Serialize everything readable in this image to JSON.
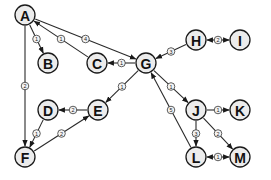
{
  "graph": {
    "type": "weighted-directed-graph",
    "nodes": [
      {
        "id": "A",
        "label": "A",
        "x": 25,
        "y": 15
      },
      {
        "id": "B",
        "label": "B",
        "x": 48,
        "y": 63
      },
      {
        "id": "C",
        "label": "C",
        "x": 97,
        "y": 63
      },
      {
        "id": "G",
        "label": "G",
        "x": 146,
        "y": 63
      },
      {
        "id": "H",
        "label": "H",
        "x": 196,
        "y": 40
      },
      {
        "id": "I",
        "label": "I",
        "x": 240,
        "y": 40
      },
      {
        "id": "D",
        "label": "D",
        "x": 48,
        "y": 110
      },
      {
        "id": "E",
        "label": "E",
        "x": 98,
        "y": 110
      },
      {
        "id": "F",
        "label": "F",
        "x": 25,
        "y": 157
      },
      {
        "id": "J",
        "label": "J",
        "x": 196,
        "y": 110
      },
      {
        "id": "K",
        "label": "K",
        "x": 240,
        "y": 110
      },
      {
        "id": "L",
        "label": "L",
        "x": 196,
        "y": 157
      },
      {
        "id": "M",
        "label": "M",
        "x": 240,
        "y": 157
      }
    ],
    "edges": [
      {
        "from": "A",
        "to": "B",
        "weight": "1",
        "direction": "forward"
      },
      {
        "from": "C",
        "to": "A",
        "weight": "1",
        "direction": "forward"
      },
      {
        "from": "A",
        "to": "G",
        "weight": "4",
        "direction": "forward"
      },
      {
        "from": "A",
        "to": "F",
        "weight": "2",
        "direction": "forward"
      },
      {
        "from": "G",
        "to": "C",
        "weight": "1",
        "direction": "forward"
      },
      {
        "from": "H",
        "to": "G",
        "weight": "3",
        "direction": "forward"
      },
      {
        "from": "H",
        "to": "I",
        "weight": "2",
        "direction": "both"
      },
      {
        "from": "G",
        "to": "E",
        "weight": "1",
        "direction": "forward"
      },
      {
        "from": "E",
        "to": "D",
        "weight": "2",
        "direction": "forward"
      },
      {
        "from": "D",
        "to": "F",
        "weight": "1",
        "direction": "forward"
      },
      {
        "from": "F",
        "to": "E",
        "weight": "2",
        "direction": "forward"
      },
      {
        "from": "G",
        "to": "J",
        "weight": "1",
        "direction": "forward"
      },
      {
        "from": "L",
        "to": "G",
        "weight": "5",
        "direction": "forward"
      },
      {
        "from": "J",
        "to": "K",
        "weight": "1",
        "direction": "forward"
      },
      {
        "from": "J",
        "to": "L",
        "weight": "3",
        "direction": "forward"
      },
      {
        "from": "J",
        "to": "M",
        "weight": "2",
        "direction": "forward"
      },
      {
        "from": "L",
        "to": "M",
        "weight": "1",
        "direction": "both"
      }
    ],
    "style": {
      "node_radius": 10,
      "node_fill": "#ececec",
      "stroke": "#1a1a1a",
      "background": "#ffffff"
    }
  }
}
